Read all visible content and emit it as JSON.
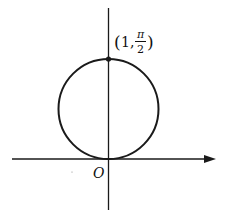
{
  "diagram": {
    "origin_label": "O",
    "point_label": {
      "open": "(",
      "r": "1,",
      "theta_num": "π",
      "theta_den": "2",
      "close": ")"
    },
    "colors": {
      "stroke": "#1a1a1a",
      "background": "#ffffff"
    }
  }
}
